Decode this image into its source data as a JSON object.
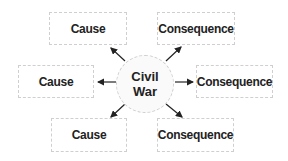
{
  "diagram": {
    "center": {
      "line1": "Civil",
      "line2": "War"
    },
    "nodes": [
      {
        "id": "top-left",
        "label": "Cause"
      },
      {
        "id": "top-right",
        "label": "Consequence"
      },
      {
        "id": "mid-left",
        "label": "Cause"
      },
      {
        "id": "mid-right",
        "label": "Consequence"
      },
      {
        "id": "bottom-left",
        "label": "Cause"
      },
      {
        "id": "bottom-right",
        "label": "Consequence"
      }
    ],
    "colors": {
      "border": "#cfcfcf",
      "text": "#222222",
      "arrow": "#222222"
    }
  }
}
